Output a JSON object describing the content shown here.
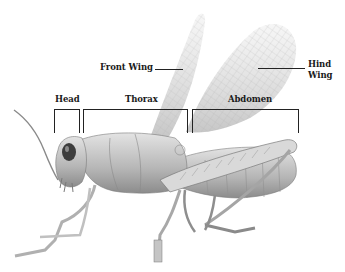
{
  "diagram": {
    "labels": {
      "front_wing": "Front Wing",
      "hind_wing_line1": "Hind",
      "hind_wing_line2": "Wing",
      "head": "Head",
      "thorax": "Thorax",
      "abdomen": "Abdomen"
    },
    "colors": {
      "background": "#ffffff",
      "label_text": "#1a1a1a",
      "lines": "#222222",
      "wing": "#c9c9c9",
      "body_light": "#d6d6d6",
      "body_mid": "#a8a8a8",
      "body_dark": "#4a4a4a"
    }
  }
}
